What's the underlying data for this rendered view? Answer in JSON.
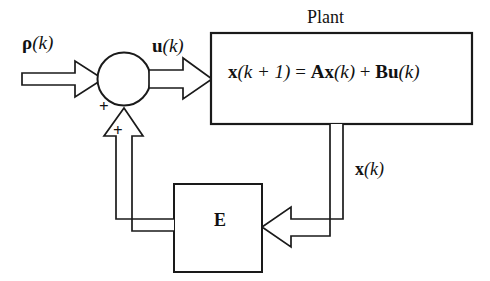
{
  "figure": {
    "type": "block-diagram",
    "background_color": "#ffffff",
    "line_color": "#1a1a1a"
  },
  "labels": {
    "reference_input": "ρ(k)",
    "reference_input_symbol": "ρ",
    "reference_input_arg": "(k)",
    "control_input": "u(k)",
    "control_input_symbol": "u",
    "control_input_arg": "(k)",
    "plant_title": "Plant",
    "state_feedback_signal": "x(k)",
    "state_feedback_symbol": "x",
    "state_feedback_arg": "(k)",
    "feedback_block": "E",
    "sum_sign_reference": "+",
    "sum_sign_feedback": "+"
  },
  "plant_equation": {
    "full_text": "x(k + 1) = Ax(k) + Bu(k)",
    "lhs_state": "x",
    "lhs_arg": "(k + 1)",
    "equals": "=",
    "matrix_a": "A",
    "state_x": "x",
    "state_arg": "(k)",
    "plus": "+",
    "matrix_b": "B",
    "input_u": "u",
    "input_arg": "(k)"
  },
  "blocks": [
    {
      "name": "summing-junction",
      "shape": "circle",
      "label": "",
      "inputs": [
        "ρ(k)",
        "E output"
      ],
      "output": "u(k)"
    },
    {
      "name": "plant-block",
      "shape": "rectangle",
      "label": "Plant",
      "contents": "x(k + 1) = Ax(k) + Bu(k)",
      "input": "u(k)",
      "output": "x(k)"
    },
    {
      "name": "e-block",
      "shape": "rectangle",
      "label": "E",
      "input": "x(k)",
      "output": "feedback to summing junction"
    }
  ],
  "signals": [
    {
      "name": "reference-signal",
      "label": "ρ(k)",
      "from": "external",
      "to": "summing-junction",
      "style": "block-arrow"
    },
    {
      "name": "control-signal",
      "label": "u(k)",
      "from": "summing-junction",
      "to": "plant-block",
      "style": "block-arrow"
    },
    {
      "name": "state-signal",
      "label": "x(k)",
      "from": "plant-block",
      "to": "e-block",
      "style": "block-arrow"
    },
    {
      "name": "feedback-signal",
      "label": "",
      "from": "e-block",
      "to": "summing-junction",
      "style": "block-arrow"
    }
  ]
}
